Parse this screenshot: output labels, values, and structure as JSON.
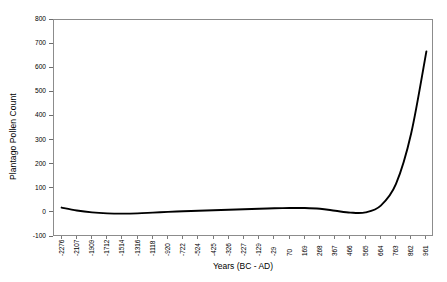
{
  "chart_data": {
    "type": "line",
    "title": "",
    "xlabel": "Years (BC - AD)",
    "ylabel": "Plantago Pollen Count",
    "ylim": [
      -100,
      800
    ],
    "yticks": [
      800,
      700,
      600,
      500,
      400,
      300,
      200,
      100,
      0,
      -100
    ],
    "grid": false,
    "legend_position": "none",
    "line_color": "#000000",
    "x": [
      "-2276",
      "-2107",
      "-1909",
      "-1712",
      "-1514",
      "-1316",
      "-1118",
      "-920",
      "-722",
      "-524",
      "-425",
      "-326",
      "-227",
      "-129",
      "-29",
      "70",
      "169",
      "268",
      "367",
      "466",
      "565",
      "664",
      "763",
      "862",
      "961"
    ],
    "values": [
      22,
      10,
      2,
      -2,
      -3,
      -2,
      1,
      4,
      7,
      9,
      11,
      13,
      15,
      17,
      19,
      20,
      20,
      17,
      9,
      1,
      2,
      30,
      120,
      330,
      670
    ]
  },
  "axis": {
    "x_tick_labels": [
      "-2276",
      "-2107",
      "-1909",
      "-1712",
      "-1514",
      "-1316",
      "-1118",
      "-920",
      "-722",
      "-524",
      "-425",
      "-326",
      "-227",
      "-129",
      "-29",
      "70",
      "169",
      "268",
      "367",
      "466",
      "565",
      "664",
      "763",
      "862",
      "961"
    ],
    "y_tick_labels": [
      "800",
      "700",
      "600",
      "500",
      "400",
      "300",
      "200",
      "100",
      "0",
      "-100"
    ]
  }
}
